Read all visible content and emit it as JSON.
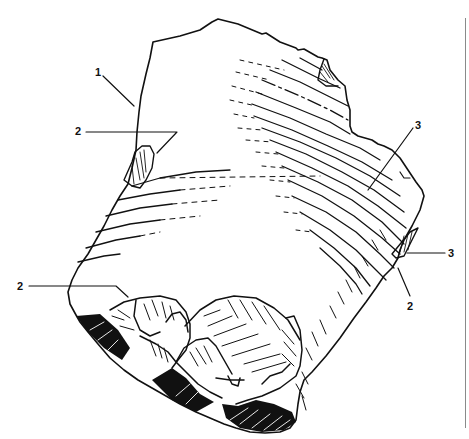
{
  "figure": {
    "type": "archaeological-line-drawing",
    "background": "#ffffff",
    "ink": "#111111",
    "frame_line_color": "#8a8a8a"
  },
  "labels": [
    {
      "id": "label-1",
      "text": "1",
      "x": 96,
      "y": 67
    },
    {
      "id": "label-2-upper-left",
      "text": "2",
      "x": 74,
      "y": 126
    },
    {
      "id": "label-3-upper-right",
      "text": "3",
      "x": 415,
      "y": 120
    },
    {
      "id": "label-3-right",
      "text": "3",
      "x": 448,
      "y": 248
    },
    {
      "id": "label-2-right",
      "text": "2",
      "x": 407,
      "y": 301
    },
    {
      "id": "label-2-lower-left",
      "text": "2",
      "x": 16,
      "y": 281
    }
  ]
}
